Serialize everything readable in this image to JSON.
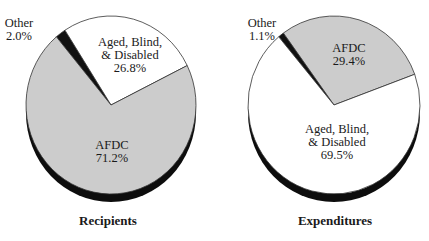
{
  "chart_data": [
    {
      "type": "pie",
      "title": "Recipients",
      "slices": [
        {
          "label": "Other",
          "value": 2.0,
          "display": "2.0%",
          "color": "#111111"
        },
        {
          "label": "Aged, Blind, & Disabled",
          "value": 26.8,
          "display": "26.8%",
          "color": "#ffffff"
        },
        {
          "label": "AFDC",
          "value": 71.2,
          "display": "71.2%",
          "color": "#cccccc"
        }
      ],
      "start_angle_deg": -40,
      "legend": "none (labels on/near slices)"
    },
    {
      "type": "pie",
      "title": "Expenditures",
      "slices": [
        {
          "label": "Other",
          "value": 1.1,
          "display": "1.1%",
          "color": "#111111"
        },
        {
          "label": "AFDC",
          "value": 29.4,
          "display": "29.4%",
          "color": "#cccccc"
        },
        {
          "label": "Aged, Blind, & Disabled",
          "value": 69.5,
          "display": "69.5%",
          "color": "#ffffff"
        }
      ],
      "start_angle_deg": -40,
      "legend": "none (labels on/near slices)"
    }
  ],
  "pies": [
    {
      "title": "Recipients",
      "geometry": {
        "cx": 111,
        "cy": 105,
        "rx": 85,
        "ry": 89,
        "shadow_dy": 8
      },
      "labels": [
        {
          "lines": [
            "Other",
            "2.0%"
          ],
          "x": 19,
          "y": 27,
          "anchor": "middle"
        },
        {
          "lines": [
            "Aged, Blind,",
            "& Disabled",
            "26.8%"
          ],
          "x": 130,
          "y": 46,
          "anchor": "middle"
        },
        {
          "lines": [
            "AFDC",
            "71.2%"
          ],
          "x": 112,
          "y": 149,
          "anchor": "middle"
        }
      ],
      "title_pos": {
        "x": 108,
        "y": 225
      }
    },
    {
      "title": "Expenditures",
      "geometry": {
        "cx": 334,
        "cy": 105,
        "rx": 86,
        "ry": 89,
        "shadow_dy": 8
      },
      "labels": [
        {
          "lines": [
            "Other",
            "1.1%"
          ],
          "x": 262,
          "y": 27,
          "anchor": "middle"
        },
        {
          "lines": [
            "AFDC",
            "29.4%"
          ],
          "x": 349,
          "y": 52,
          "anchor": "middle"
        },
        {
          "lines": [
            "Aged, Blind,",
            "& Disabled",
            "69.5%"
          ],
          "x": 337,
          "y": 133,
          "anchor": "middle"
        }
      ],
      "title_pos": {
        "x": 335,
        "y": 225
      }
    }
  ]
}
